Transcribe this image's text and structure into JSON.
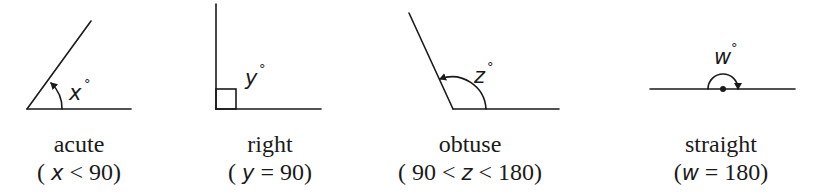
{
  "diagram": {
    "angles": [
      {
        "id": "acute",
        "name": "acute",
        "variable": "x",
        "degree_symbol": "°",
        "condition_prefix": "( ",
        "condition_var": "x",
        "condition_suffix": " < 90)"
      },
      {
        "id": "right",
        "name": "right",
        "variable": "y",
        "degree_symbol": "°",
        "condition_prefix": "( ",
        "condition_var": "y",
        "condition_suffix": " = 90)"
      },
      {
        "id": "obtuse",
        "name": "obtuse",
        "variable": "z",
        "degree_symbol": "°",
        "condition_prefix": "( 90 < ",
        "condition_var": "z",
        "condition_suffix": " < 180)"
      },
      {
        "id": "straight",
        "name": "straight",
        "variable": "w",
        "degree_symbol": "°",
        "condition_prefix": "(",
        "condition_var": "w",
        "condition_suffix": " = 180)"
      }
    ],
    "colors": {
      "ink": "#1a1a1a",
      "background": "#ffffff"
    }
  }
}
